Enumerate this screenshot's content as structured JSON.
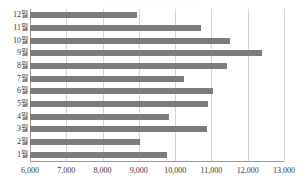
{
  "top_clipped_text": "· · ·· ·· ·· · ·· ·· ·",
  "chart_data": {
    "type": "bar",
    "orientation": "horizontal",
    "title": "",
    "subtitle": "",
    "xlabel": "",
    "ylabel": "",
    "categories": [
      "1월",
      "2월",
      "3월",
      "4월",
      "5월",
      "6월",
      "7월",
      "8월",
      "9월",
      "10월",
      "11월",
      "12월"
    ],
    "values": [
      9770,
      9030,
      10870,
      9830,
      10900,
      11040,
      10240,
      11430,
      12400,
      11510,
      10710,
      8950
    ],
    "series": [
      {
        "name": "",
        "values": [
          9770,
          9030,
          10870,
          9830,
          10900,
          11040,
          10240,
          11430,
          12400,
          11510,
          10710,
          8950
        ]
      }
    ],
    "xlim": [
      6000,
      13000
    ],
    "xticks": [
      6000,
      7000,
      8000,
      9000,
      10000,
      11000,
      12000,
      13000
    ],
    "xticklabels": [
      "6,000",
      "7,000",
      "8,000",
      "9,000",
      "10,000",
      "11,000",
      "12,000",
      "13,000"
    ],
    "display_order_top_to_bottom": [
      "12월",
      "11월",
      "10월",
      "9월",
      "8월",
      "7월",
      "6월",
      "5월",
      "4월",
      "3월",
      "2월",
      "1월"
    ],
    "grid": true,
    "grid_axis": "x",
    "legend": false,
    "legend_position": "none",
    "bar_color": "#7c7c7c",
    "grid_color": "#d4d4d4",
    "axis_color": "#9a9a9a",
    "background_color": "#ffffff",
    "data_labels": false
  }
}
